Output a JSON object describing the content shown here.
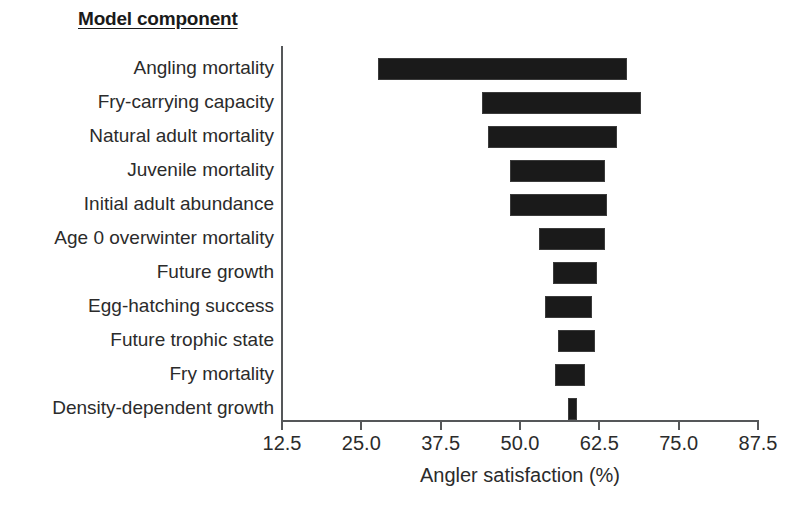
{
  "header": {
    "column_title": "Model component"
  },
  "chart_data": {
    "type": "bar",
    "orientation": "horizontal-tornado",
    "title": "",
    "xlabel": "Angler satisfaction (%)",
    "ylabel": "Model component",
    "xlim": [
      12.5,
      87.5
    ],
    "xticks": [
      "12.5",
      "25.0",
      "37.5",
      "50.0",
      "62.5",
      "75.0",
      "87.5"
    ],
    "xtick_values": [
      12.5,
      25.0,
      37.5,
      50.0,
      62.5,
      75.0,
      87.5
    ],
    "grid": false,
    "legend": "none",
    "bar_color": "#1a1a1a",
    "categories": [
      "Angling mortality",
      "Fry-carrying capacity",
      "Natural adult mortality",
      "Juvenile mortality",
      "Initial adult abundance",
      "Age 0 overwinter mortality",
      "Future growth",
      "Egg-hatching success",
      "Future trophic state",
      "Fry mortality",
      "Density-dependent growth"
    ],
    "bars": [
      {
        "label": "Angling mortality",
        "low": 27.6,
        "high": 66.8,
        "range": 39.2
      },
      {
        "label": "Fry-carrying capacity",
        "low": 44.0,
        "high": 69.1,
        "range": 25.1
      },
      {
        "label": "Natural adult mortality",
        "low": 44.9,
        "high": 65.3,
        "range": 20.4
      },
      {
        "label": "Juvenile mortality",
        "low": 48.4,
        "high": 63.4,
        "range": 15.0
      },
      {
        "label": "Initial adult abundance",
        "low": 48.4,
        "high": 63.7,
        "range": 15.3
      },
      {
        "label": "Age 0 overwinter mortality",
        "low": 53.0,
        "high": 63.4,
        "range": 10.4
      },
      {
        "label": "Future growth",
        "low": 55.2,
        "high": 62.1,
        "range": 6.9
      },
      {
        "label": "Egg-hatching success",
        "low": 53.9,
        "high": 61.4,
        "range": 7.5
      },
      {
        "label": "Future trophic state",
        "low": 56.0,
        "high": 61.8,
        "range": 5.8
      },
      {
        "label": "Fry mortality",
        "low": 55.5,
        "high": 60.3,
        "range": 4.8
      },
      {
        "label": "Density-dependent growth",
        "low": 57.6,
        "high": 59.0,
        "range": 1.4
      }
    ]
  }
}
